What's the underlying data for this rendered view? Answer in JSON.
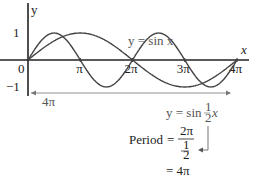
{
  "chart_data": {
    "type": "line",
    "title": "",
    "xlabel": "x",
    "ylabel": "y",
    "xlim": [
      0,
      12.566
    ],
    "ylim": [
      -1,
      1
    ],
    "x_ticks": [
      {
        "value": 0,
        "label": "0"
      },
      {
        "value": 3.1416,
        "label": "π"
      },
      {
        "value": 6.2832,
        "label": "2π"
      },
      {
        "value": 9.4248,
        "label": "3π"
      },
      {
        "value": 12.5664,
        "label": "4π"
      }
    ],
    "y_ticks": [
      {
        "value": 1,
        "label": "1"
      },
      {
        "value": -1,
        "label": "−1"
      }
    ],
    "series": [
      {
        "name": "y = sin x",
        "function": "sin(x)",
        "domain": [
          0,
          12.566
        ]
      },
      {
        "name": "y = sin ½x",
        "function": "sin(x/2)",
        "domain": [
          0,
          12.566
        ]
      }
    ],
    "annotations": {
      "span_label": "4π",
      "label_sin_x": "y = sin x",
      "label_sin_half": "y = sin ½x",
      "period_word": "Period",
      "period_num": "2π",
      "period_den_num": "1",
      "period_den_den": "2",
      "period_result": "= 4π",
      "eq": "="
    }
  }
}
